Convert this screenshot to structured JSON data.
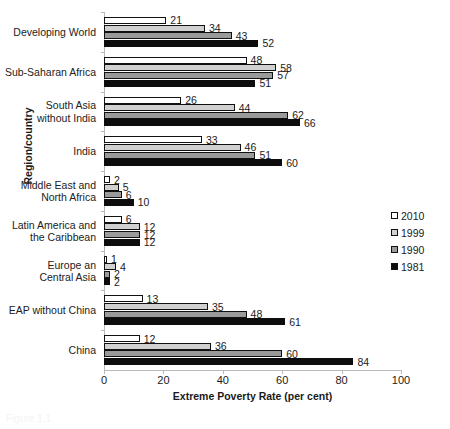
{
  "chart_data": {
    "type": "bar",
    "orientation": "horizontal",
    "title": "",
    "xlabel": "Extreme Poverty Rate (per cent)",
    "ylabel": "Region/country",
    "xlim": [
      0,
      100
    ],
    "xticks": [
      0,
      20,
      40,
      60,
      80,
      100
    ],
    "grid": false,
    "legend_position": "right-middle",
    "categories": [
      "Developing World",
      "Sub-Saharan Africa",
      "South Asia\nwithout India",
      "India",
      "Middle East and\nNorth Africa",
      "Latin America and\nthe Caribbean",
      "Europe an\nCentral Asia",
      "EAP without China",
      "China"
    ],
    "series": [
      {
        "name": "2010",
        "color": "#ffffff",
        "values": [
          21,
          48,
          26,
          33,
          2,
          6,
          1,
          13,
          12
        ]
      },
      {
        "name": "1999",
        "color": "#d0d0d0",
        "values": [
          34,
          58,
          44,
          46,
          5,
          12,
          4,
          35,
          36
        ]
      },
      {
        "name": "1990",
        "color": "#9a9a9a",
        "values": [
          43,
          57,
          62,
          51,
          6,
          12,
          2,
          48,
          60
        ]
      },
      {
        "name": "1981",
        "color": "#0d0d0d",
        "values": [
          52,
          51,
          66,
          60,
          10,
          12,
          2,
          61,
          84
        ]
      }
    ]
  },
  "categories_display": [
    {
      "lines": [
        "Developing World"
      ]
    },
    {
      "lines": [
        "Sub-Saharan Africa"
      ]
    },
    {
      "lines": [
        "South Asia",
        "without India"
      ]
    },
    {
      "lines": [
        "India"
      ]
    },
    {
      "lines": [
        "Middle East and",
        "North Africa"
      ]
    },
    {
      "lines": [
        "Latin America and",
        "the Caribbean"
      ]
    },
    {
      "lines": [
        "Europe an",
        "Central Asia"
      ]
    },
    {
      "lines": [
        "EAP without China"
      ]
    },
    {
      "lines": [
        "China"
      ]
    }
  ],
  "axes": {
    "x_title": "Extreme Poverty Rate (per cent)",
    "y_title": "Region/country",
    "x_tick_labels": [
      "0",
      "20",
      "40",
      "60",
      "80",
      "100"
    ]
  },
  "legend": {
    "items": [
      {
        "label": "2010",
        "class": "s2010"
      },
      {
        "label": "1999",
        "class": "s1999"
      },
      {
        "label": "1990",
        "class": "s1990"
      },
      {
        "label": "1981",
        "class": "s1981"
      }
    ]
  },
  "caption": {
    "text": "Figure 1.1"
  }
}
